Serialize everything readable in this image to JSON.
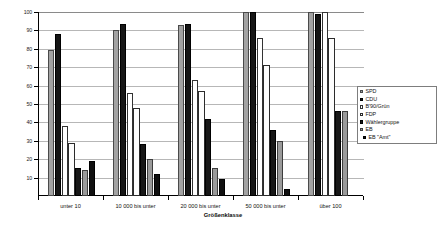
{
  "chart_data": {
    "type": "bar",
    "title": "",
    "xlabel": "Größenklasse",
    "ylabel": "",
    "ylim": [
      0,
      100
    ],
    "yticks": [
      0,
      10,
      20,
      30,
      40,
      50,
      60,
      70,
      80,
      90,
      100
    ],
    "ytick_labels": [
      "0",
      "10",
      "20",
      "30",
      "40",
      "50",
      "60",
      "70",
      "80",
      "90",
      "100"
    ],
    "grid": true,
    "legend_position": "right",
    "categories": [
      "unter 10",
      "10 000 bis unter",
      "20 000 bis unter",
      "50 000 bis unter",
      "über 100"
    ],
    "series": [
      {
        "name": "SPD",
        "values": [
          79.5,
          90.0,
          93.0,
          100.0,
          100.0
        ]
      },
      {
        "name": "CDU",
        "values": [
          88.0,
          93.5,
          93.5,
          100.0,
          99.0
        ]
      },
      {
        "name": "B'90/Grün",
        "values": [
          38.0,
          56.0,
          63.0,
          86.0,
          100.0
        ]
      },
      {
        "name": "FDP",
        "values": [
          29.0,
          48.0,
          57.0,
          71.0,
          86.0
        ]
      },
      {
        "name": "Wählergruppe",
        "values": [
          15.0,
          28.0,
          42.0,
          36.0,
          46.0
        ]
      },
      {
        "name": "EB",
        "values": [
          14.0,
          20.0,
          15.0,
          30.0,
          46.0
        ]
      },
      {
        "name": "EB \"Amt\"",
        "values": [
          19.0,
          12.0,
          9.0,
          4.0,
          0.0
        ]
      }
    ]
  },
  "legend": {
    "items": [
      {
        "label": "SPD"
      },
      {
        "label": "CDU"
      },
      {
        "label": "B'90/Grün"
      },
      {
        "label": "FDP"
      },
      {
        "label": "Wählergruppe"
      },
      {
        "label": "EB"
      },
      {
        "label": "EB \"Amt\""
      }
    ]
  },
  "colors": {
    "spd": "#a3a3a3",
    "cdu": "#161616",
    "gruen": "#ffffff",
    "fdp": "#fdfdfd",
    "waehlergruppe": "#171717",
    "eb": "#9a9a9a",
    "eb_amt": "#101010",
    "grid": "#b7b7b7",
    "axis": "#000000"
  }
}
